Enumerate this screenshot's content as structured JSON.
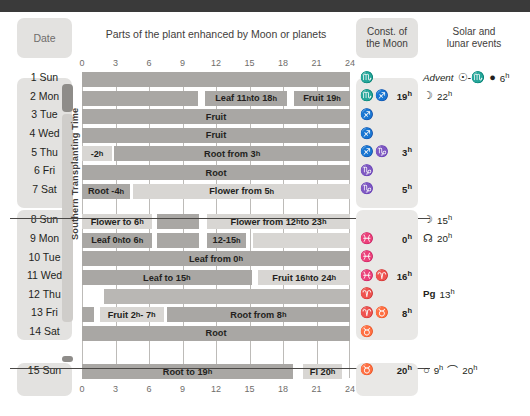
{
  "columns": {
    "date_header": "Date",
    "chart_header": "Parts of the plant enhanced by Moon or planets",
    "const_header_l1": "Const. of",
    "const_header_l2": "the Moon",
    "events_header_l1": "Solar and",
    "events_header_l2": "lunar events",
    "vertical_label": "Southern Transplanting Time"
  },
  "axis": {
    "ticks": [
      "0",
      "3",
      "6",
      "9",
      "12",
      "15",
      "18",
      "21",
      "24"
    ],
    "min": 0,
    "max": 24
  },
  "colors": {
    "dark_bar": "#a9a7a4",
    "light_bar": "#d8d6d3",
    "mid_bar": "#b9b7b4",
    "panel": "#e3e2e0",
    "topbar": "#3a3a3a"
  },
  "chart_data": {
    "type": "bar",
    "title": "Parts of the plant enhanced by Moon or planets",
    "xlabel": "hours",
    "xlim": [
      0,
      24
    ],
    "grid": true,
    "categories": [
      "1 Sun",
      "2 Mon",
      "3 Tue",
      "4 Wed",
      "5 Thu",
      "6 Fri",
      "7 Sat",
      "8 Sun",
      "9 Mon",
      "10 Tue",
      "11 Wed",
      "12 Thu",
      "13 Fri",
      "14 Sat",
      "15 Sun"
    ],
    "rows": [
      {
        "date": "1 Sun",
        "segments": [
          {
            "start": 0,
            "end": 24,
            "label": "",
            "tone": "dark"
          }
        ]
      },
      {
        "date": "2 Mon",
        "segments": [
          {
            "start": 0,
            "end": 10.4,
            "label": "",
            "tone": "dark"
          },
          {
            "start": 11,
            "end": 18.4,
            "label": "Leaf 11h to 18h",
            "tone": "dark"
          },
          {
            "start": 19,
            "end": 24,
            "label": "Fruit 19h",
            "tone": "dark"
          }
        ]
      },
      {
        "date": "3 Tue",
        "segments": [
          {
            "start": 0,
            "end": 24,
            "label": "Fruit",
            "tone": "dark"
          }
        ]
      },
      {
        "date": "4 Wed",
        "segments": [
          {
            "start": 0,
            "end": 24,
            "label": "Fruit",
            "tone": "dark"
          }
        ]
      },
      {
        "date": "5 Thu",
        "segments": [
          {
            "start": 0,
            "end": 2.7,
            "label": "-2h",
            "tone": "light"
          },
          {
            "start": 2.9,
            "end": 24,
            "label": "Root from 3h",
            "tone": "dark"
          }
        ]
      },
      {
        "date": "6 Fri",
        "segments": [
          {
            "start": 0,
            "end": 24,
            "label": "Root",
            "tone": "dark"
          }
        ]
      },
      {
        "date": "7 Sat",
        "segments": [
          {
            "start": 0,
            "end": 4.3,
            "label": "Root -4h",
            "tone": "dark"
          },
          {
            "start": 4.6,
            "end": 24,
            "label": "Flower from 5h",
            "tone": "light"
          }
        ]
      },
      {
        "date": "8 Sun",
        "segments": [
          {
            "start": 0,
            "end": 6.3,
            "label": "Flower to 6h",
            "tone": "light"
          },
          {
            "start": 6.7,
            "end": 10.5,
            "label": "",
            "tone": "dark"
          },
          {
            "start": 11.2,
            "end": 24,
            "label": "Flower from 12h to 23h",
            "tone": "light"
          }
        ]
      },
      {
        "date": "9 Mon",
        "segments": [
          {
            "start": 0,
            "end": 6.3,
            "label": "Leaf 0h to 6h",
            "tone": "dark"
          },
          {
            "start": 6.7,
            "end": 10.5,
            "label": "",
            "tone": "dark"
          },
          {
            "start": 11.2,
            "end": 14.7,
            "label": "12-15h",
            "tone": "dark"
          },
          {
            "start": 15.3,
            "end": 24,
            "label": "",
            "tone": "light"
          }
        ]
      },
      {
        "date": "10 Tue",
        "segments": [
          {
            "start": 0,
            "end": 24,
            "label": "Leaf from 0h",
            "tone": "dark"
          }
        ]
      },
      {
        "date": "11 Wed",
        "segments": [
          {
            "start": 0,
            "end": 15.2,
            "label": "Leaf to 15h",
            "tone": "dark"
          },
          {
            "start": 15.8,
            "end": 24,
            "label": "Fruit 16h to 24h",
            "tone": "light"
          }
        ]
      },
      {
        "date": "12 Thu",
        "segments": [
          {
            "start": 2,
            "end": 24,
            "label": "",
            "tone": "mid"
          }
        ]
      },
      {
        "date": "13 Fri",
        "segments": [
          {
            "start": 0,
            "end": 1.1,
            "label": "",
            "tone": "dark"
          },
          {
            "start": 1.6,
            "end": 7.3,
            "label": "Fruit 2h - 7h",
            "tone": "light"
          },
          {
            "start": 7.6,
            "end": 24,
            "label": "Root from 8h",
            "tone": "dark"
          }
        ]
      },
      {
        "date": "14 Sat",
        "segments": [
          {
            "start": 0,
            "end": 24,
            "label": "Root",
            "tone": "dark"
          }
        ]
      },
      {
        "date": "15 Sun",
        "segments": [
          {
            "start": 0,
            "end": 18.9,
            "label": "Root to 19h",
            "tone": "dark"
          },
          {
            "start": 19.8,
            "end": 23.3,
            "label": "Fl 20h",
            "tone": "light"
          }
        ]
      }
    ]
  },
  "constellations": [
    {
      "symbols": "♏",
      "hour": ""
    },
    {
      "symbols": "♏♐",
      "hour": "19h"
    },
    {
      "symbols": "♐",
      "hour": ""
    },
    {
      "symbols": "♐",
      "hour": ""
    },
    {
      "symbols": "♐♑",
      "hour": "3h"
    },
    {
      "symbols": "♑",
      "hour": ""
    },
    {
      "symbols": "♑",
      "hour": "5h"
    },
    {
      "symbols": "",
      "hour": ""
    },
    {
      "symbols": "♓",
      "hour": "0h"
    },
    {
      "symbols": "♓",
      "hour": ""
    },
    {
      "symbols": "♓♈",
      "hour": "16h"
    },
    {
      "symbols": "♈",
      "hour": ""
    },
    {
      "symbols": "♈♉",
      "hour": "8h"
    },
    {
      "symbols": "♉",
      "hour": ""
    },
    {
      "symbols": "♉",
      "hour": "20h"
    }
  ],
  "events": [
    {
      "row": 0,
      "parts": [
        {
          "text": "Advent",
          "style": "italic"
        },
        {
          "text": "☉-♏",
          "style": "sym"
        },
        {
          "text": "●",
          "style": "sym"
        },
        {
          "text": "6h",
          "style": "plain"
        }
      ]
    },
    {
      "row": 1,
      "parts": [
        {
          "text": "☽",
          "style": "sym"
        },
        {
          "text": "22h",
          "style": "plain"
        }
      ]
    },
    {
      "row": 7,
      "parts": [
        {
          "text": "☽",
          "style": "sym"
        },
        {
          "text": "15h",
          "style": "plain"
        }
      ]
    },
    {
      "row": 8,
      "parts": [
        {
          "text": "☊",
          "style": "sym"
        },
        {
          "text": "20h",
          "style": "plain"
        }
      ]
    },
    {
      "row": 11,
      "parts": [
        {
          "text": "Pg",
          "style": "bold"
        },
        {
          "text": "13h",
          "style": "plain"
        }
      ]
    },
    {
      "row": 14,
      "parts": [
        {
          "text": "○",
          "style": "sym"
        },
        {
          "text": "9h",
          "style": "plain"
        },
        {
          "text": "⌒",
          "style": "sym"
        },
        {
          "text": "20h",
          "style": "plain"
        }
      ]
    }
  ]
}
